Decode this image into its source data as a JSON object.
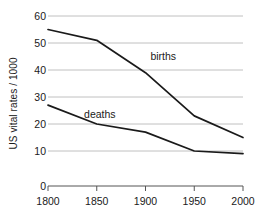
{
  "chart_data": {
    "type": "line",
    "title": "",
    "xlabel": "",
    "ylabel": "US vital rates / 1000",
    "x": [
      1800,
      1850,
      1900,
      1950,
      2000
    ],
    "xlim": [
      1800,
      2000
    ],
    "ylim": [
      0,
      60
    ],
    "yticks": [
      0,
      10,
      20,
      30,
      40,
      50,
      60
    ],
    "xticks": [
      1800,
      1850,
      1900,
      1950,
      2000
    ],
    "grid": "horizontal",
    "legend": "inline-annotations",
    "series": [
      {
        "name": "births",
        "values": [
          55,
          51,
          39,
          23,
          15
        ],
        "color": "#1a1a1a",
        "label_x": 1905,
        "label_y": 45
      },
      {
        "name": "deaths",
        "values": [
          27,
          20,
          17,
          10,
          9
        ],
        "color": "#1a1a1a",
        "label_x": 1837,
        "label_y": 23.5
      }
    ]
  },
  "axis": {
    "y_tick_labels": [
      "60",
      "50",
      "40",
      "30",
      "20",
      "10",
      "0"
    ],
    "x_tick_labels": [
      "1800",
      "1850",
      "1900",
      "1950",
      "2000"
    ],
    "y_title": "US vital rates / 1000"
  },
  "annotations": {
    "births_label": "births",
    "deaths_label": "deaths"
  },
  "colors": {
    "line": "#1a1a1a",
    "grid": "#b0b0b0",
    "axis": "#555555",
    "text": "#1a1a1a",
    "background": "#ffffff"
  }
}
